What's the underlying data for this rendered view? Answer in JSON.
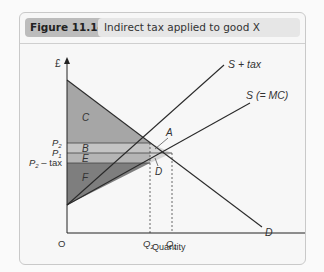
{
  "figure": {
    "number": "Figure 11.14",
    "title": "Indirect tax applied to good X"
  },
  "diagram": {
    "y_axis_label": "£",
    "x_axis_label": "Quantity",
    "origin_label": "O",
    "curves": {
      "demand": "D",
      "supply": "S (= MC)",
      "supply_tax": "S + tax"
    },
    "price_labels": {
      "p2": "P",
      "p2_sub": "2",
      "p1": "P",
      "p1_sub": "1",
      "p2_tax": "P",
      "p2_tax_sub": "2",
      "p2_tax_suffix": " – tax"
    },
    "quantity_labels": {
      "q2": "Q",
      "q2_sub": "2",
      "q1": "Q",
      "q1_sub": "1"
    },
    "areas": {
      "c": "C",
      "b": "B",
      "e": "E",
      "f": "F",
      "a": "A",
      "d": "D"
    },
    "colors": {
      "area_c": "#a6a6a6",
      "area_b": "#c4c4c4",
      "area_e": "#b5b5b5",
      "area_f": "#7e7e7e",
      "area_ad": "#d6d6d6",
      "line": "#2a2a2a"
    }
  }
}
